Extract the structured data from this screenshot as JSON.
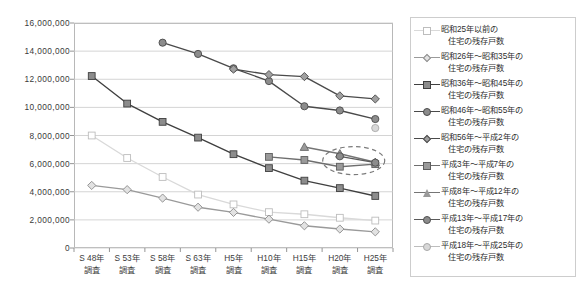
{
  "chart_data": {
    "type": "line",
    "title": "",
    "subtitle": "",
    "xlabel": "",
    "ylabel": "",
    "grid": true,
    "legend_position": "right",
    "ylim": [
      0,
      16000000
    ],
    "ytick_step": 2000000,
    "ytick_labels": [
      "16,000,000",
      "14,000,000",
      "12,000,000",
      "10,000,000",
      "8,000,000",
      "6,000,000",
      "4,000,000",
      "2,000,000",
      "0"
    ],
    "ytick_values": [
      16000000,
      14000000,
      12000000,
      10000000,
      8000000,
      6000000,
      4000000,
      2000000,
      0
    ],
    "categories": [
      "S48年\n調査",
      "S53年\n調査",
      "S58年\n調査",
      "S63年\n調査",
      "H5年\n調査",
      "H10年\n調査",
      "H15年\n調査",
      "H20年\n調査",
      "H25年\n調査"
    ],
    "xtick_labels": [
      {
        "line1": "S 48年",
        "line2": "調査"
      },
      {
        "line1": "S 53年",
        "line2": "調査"
      },
      {
        "line1": "S 58年",
        "line2": "調査"
      },
      {
        "line1": "S 63年",
        "line2": "調査"
      },
      {
        "line1": "H5年",
        "line2": "調査"
      },
      {
        "line1": "H10年",
        "line2": "調査"
      },
      {
        "line1": "H15年",
        "line2": "調査"
      },
      {
        "line1": "H20年",
        "line2": "調査"
      },
      {
        "line1": "H25年",
        "line2": "調査"
      }
    ],
    "series": [
      {
        "name": "昭和25年以前の住宅の残存戸数",
        "label_line1": "昭和25年以前の",
        "label_line2": "住宅の残存戸数",
        "marker": "square",
        "color": "#d9d9d9",
        "marker_fill": "#ffffff",
        "marker_stroke": "#bdbdbd",
        "values": [
          8000000,
          6400000,
          5050000,
          3800000,
          3100000,
          2550000,
          2400000,
          2150000,
          1950000
        ]
      },
      {
        "name": "昭和26年～昭和35年の住宅の残存戸数",
        "label_line1": "昭和26年～昭和35年の",
        "label_line2": "住宅の残存戸数",
        "marker": "diamond",
        "color": "#9a9a9a",
        "marker_fill": "#e2e2e2",
        "marker_stroke": "#8a8a8a",
        "values": [
          4450000,
          4150000,
          3550000,
          2900000,
          2530000,
          2050000,
          1580000,
          1350000,
          1150000
        ]
      },
      {
        "name": "昭和36年～昭和45年の住宅の残存戸数",
        "label_line1": "昭和36年～昭和45年の",
        "label_line2": "住宅の残存戸数",
        "marker": "square",
        "color": "#3f3f3f",
        "marker_fill": "#8c8c8c",
        "marker_stroke": "#3f3f3f",
        "values": [
          12230000,
          10270000,
          8970000,
          7850000,
          6670000,
          5680000,
          4790000,
          4260000,
          3700000
        ]
      },
      {
        "name": "昭和46年～昭和55年の住宅の残存戸数",
        "label_line1": "昭和46年～昭和55年の",
        "label_line2": "住宅の残存戸数",
        "marker": "circle",
        "color": "#4a4a4a",
        "marker_fill": "#8c8c8c",
        "marker_stroke": "#4a4a4a",
        "values": [
          null,
          null,
          14600000,
          13800000,
          12780000,
          11870000,
          10080000,
          9780000,
          9170000
        ]
      },
      {
        "name": "昭和56年～平成2年の住宅の残存戸数",
        "label_line1": "昭和56年～平成2年の",
        "label_line2": "住宅の残存戸数",
        "marker": "diamond",
        "color": "#4a4a4a",
        "marker_fill": "#a0a0a0",
        "marker_stroke": "#4a4a4a",
        "values": [
          null,
          null,
          null,
          null,
          12720000,
          12330000,
          12190000,
          10820000,
          10600000
        ]
      },
      {
        "name": "平成3年～平成7年の住宅の残存戸数",
        "label_line1": "平成3年～平成7年の",
        "label_line2": "住宅の残存戸数",
        "marker": "square",
        "color": "#6e6e6e",
        "marker_fill": "#9a9a9a",
        "marker_stroke": "#5d5d5d",
        "values": [
          null,
          null,
          null,
          null,
          null,
          6480000,
          6260000,
          5780000,
          5960000
        ]
      },
      {
        "name": "平成8年～平成12年の住宅の残存戸数",
        "label_line1": "平成8年～平成12年の",
        "label_line2": "住宅の残存戸数",
        "marker": "triangle",
        "color": "#757575",
        "marker_fill": "#9a9a9a",
        "marker_stroke": "#6a6a6a",
        "values": [
          null,
          null,
          null,
          null,
          null,
          null,
          7180000,
          6700000,
          6100000
        ]
      },
      {
        "name": "平成13年～平成17年の住宅の残存戸数",
        "label_line1": "平成13年～平成17年の",
        "label_line2": "住宅の残存戸数",
        "marker": "circle",
        "color": "#5a5a5a",
        "marker_fill": "#8c8c8c",
        "marker_stroke": "#4f4f4f",
        "values": [
          null,
          null,
          null,
          null,
          null,
          null,
          null,
          6520000,
          6070000
        ]
      },
      {
        "name": "平成18年～平成25年の住宅の残存戸数",
        "label_line1": "平成18年～平成25年の",
        "label_line2": "住宅の残存戸数",
        "marker": "circle",
        "color": "#bdbdbd",
        "marker_fill": "#d8d8d8",
        "marker_stroke": "#a8a8a8",
        "values": [
          null,
          null,
          null,
          null,
          null,
          null,
          null,
          null,
          8530000
        ]
      }
    ],
    "annotations": [
      {
        "type": "ellipse",
        "style": "dashed",
        "color": "#7a7a7a",
        "center_x_category": "H25年調査",
        "center_value": 6000000,
        "note": "dashed oval highlighting the converging recent-vintage series near 6,000,000"
      }
    ]
  }
}
